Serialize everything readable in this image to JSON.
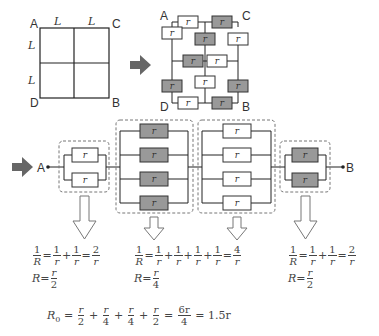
{
  "square": {
    "corners": {
      "A": "A",
      "B": "B",
      "C": "C",
      "D": "D"
    },
    "side_label": "L"
  },
  "grid_network": {
    "corners": {
      "A": "A",
      "B": "B",
      "C": "C",
      "D": "D"
    },
    "resistor_label": "r",
    "colors": {
      "shaded": "#999999",
      "plain": "#ffffff"
    }
  },
  "circuit": {
    "start_label": "A",
    "end_label": "B",
    "resistor_label": "r",
    "groups": [
      {
        "count": 2,
        "shaded": false
      },
      {
        "count": 4,
        "shaded": true
      },
      {
        "count": 4,
        "shaded": false
      },
      {
        "count": 2,
        "shaded": true
      }
    ]
  },
  "equations": [
    {
      "line1": {
        "lhs_num": "1",
        "lhs_den": "R",
        "terms": [
          "1/r",
          "1/r"
        ],
        "result_num": "2",
        "result_den": "r"
      },
      "line2": {
        "num": "r",
        "den": "2"
      }
    },
    {
      "line1": {
        "lhs_num": "1",
        "lhs_den": "R",
        "terms": [
          "1/r",
          "1/r",
          "1/r",
          "1/r"
        ],
        "result_num": "4",
        "result_den": "r"
      },
      "line2": {
        "num": "r",
        "den": "4"
      }
    },
    {
      "line1": {
        "lhs_num": "1",
        "lhs_den": "R",
        "terms": [
          "1/r",
          "1/r"
        ],
        "result_num": "2",
        "result_den": "r"
      },
      "line2": {
        "num": "r",
        "den": "2"
      }
    }
  ],
  "total": {
    "lhs": "R",
    "lhs_sub": "0",
    "terms": [
      [
        "r",
        "2"
      ],
      [
        "r",
        "4"
      ],
      [
        "r",
        "4"
      ],
      [
        "r",
        "2"
      ]
    ],
    "sum": [
      "6r",
      "4"
    ],
    "result": "1.5r"
  },
  "colors": {
    "arrow_fill": "#666666",
    "dash": "#777777",
    "shaded_resistor": "#999999"
  }
}
